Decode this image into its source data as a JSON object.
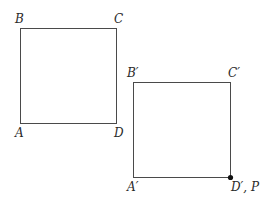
{
  "diagram": {
    "square_original": {
      "labels": {
        "A": "A",
        "B": "B",
        "C": "C",
        "D": "D"
      }
    },
    "square_image": {
      "labels": {
        "A": "A′",
        "B": "B′",
        "C": "C′",
        "D": "D′, P"
      }
    },
    "stroke_color": "#4a4a4a",
    "point_color": "#111111"
  }
}
